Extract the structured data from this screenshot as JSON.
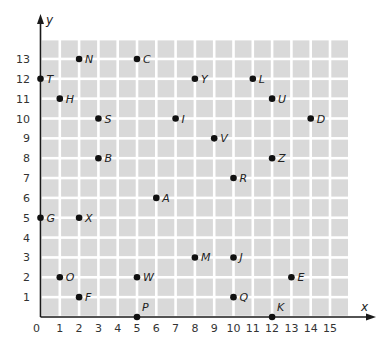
{
  "chart_data": {
    "type": "scatter",
    "title": "",
    "xlabel": "x",
    "ylabel": "y",
    "xlim": [
      0,
      16
    ],
    "ylim": [
      0,
      14
    ],
    "grid": true,
    "x_ticks": [
      "0",
      "1",
      "2",
      "3",
      "4",
      "5",
      "6",
      "7",
      "8",
      "9",
      "10",
      "11",
      "12",
      "13",
      "14",
      "15"
    ],
    "y_ticks": [
      "1",
      "2",
      "3",
      "4",
      "5",
      "6",
      "7",
      "8",
      "9",
      "10",
      "11",
      "12",
      "13"
    ],
    "points": [
      {
        "label": "N",
        "x": 2,
        "y": 13
      },
      {
        "label": "C",
        "x": 5,
        "y": 13
      },
      {
        "label": "T",
        "x": 0,
        "y": 12
      },
      {
        "label": "Y",
        "x": 8,
        "y": 12
      },
      {
        "label": "L",
        "x": 11,
        "y": 12
      },
      {
        "label": "H",
        "x": 1,
        "y": 11
      },
      {
        "label": "U",
        "x": 12,
        "y": 11
      },
      {
        "label": "S",
        "x": 3,
        "y": 10
      },
      {
        "label": "I",
        "x": 7,
        "y": 10
      },
      {
        "label": "D",
        "x": 14,
        "y": 10
      },
      {
        "label": "V",
        "x": 9,
        "y": 9
      },
      {
        "label": "B",
        "x": 3,
        "y": 8
      },
      {
        "label": "Z",
        "x": 12,
        "y": 8
      },
      {
        "label": "R",
        "x": 10,
        "y": 7
      },
      {
        "label": "A",
        "x": 6,
        "y": 6
      },
      {
        "label": "G",
        "x": 0,
        "y": 5
      },
      {
        "label": "X",
        "x": 2,
        "y": 5
      },
      {
        "label": "M",
        "x": 8,
        "y": 3
      },
      {
        "label": "J",
        "x": 10,
        "y": 3
      },
      {
        "label": "O",
        "x": 1,
        "y": 2
      },
      {
        "label": "W",
        "x": 5,
        "y": 2
      },
      {
        "label": "E",
        "x": 13,
        "y": 2
      },
      {
        "label": "F",
        "x": 2,
        "y": 1
      },
      {
        "label": "Q",
        "x": 10,
        "y": 1
      },
      {
        "label": "P",
        "x": 5,
        "y": 0
      },
      {
        "label": "K",
        "x": 12,
        "y": 0
      }
    ]
  },
  "colors": {
    "grid_cell": "#d9d9d9",
    "grid_gap": "#ffffff",
    "axis": "#1a1a1a",
    "point": "#111111"
  }
}
